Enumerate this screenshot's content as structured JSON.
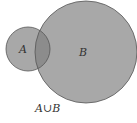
{
  "diagram": {
    "type": "venn",
    "sets": [
      {
        "id": "A",
        "label": "A"
      },
      {
        "id": "B",
        "label": "B"
      }
    ],
    "caption": "A∪B",
    "colors": {
      "fill": "#a8a8a8",
      "intersection": "#8c8c8c",
      "stroke": "#555555"
    }
  }
}
